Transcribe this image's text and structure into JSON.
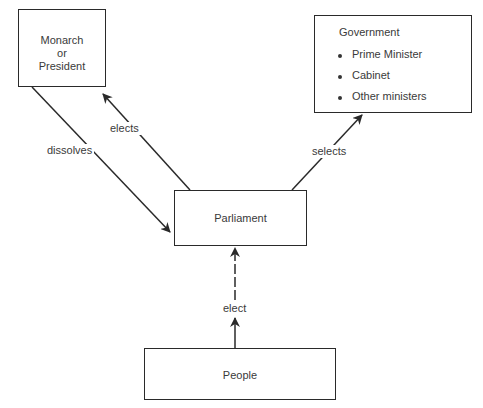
{
  "diagram": {
    "nodes": {
      "monarch": {
        "lines": [
          "Monarch",
          "or",
          "President"
        ]
      },
      "government": {
        "title": "Government",
        "items": [
          "Prime Minister",
          "Cabinet",
          "Other ministers"
        ]
      },
      "parliament": {
        "label": "Parliament"
      },
      "people": {
        "label": "People"
      }
    },
    "edges": [
      {
        "from": "Parliament",
        "to": "Monarch or President",
        "label": "elects"
      },
      {
        "from": "Monarch or President",
        "to": "Parliament",
        "label": "dissolves"
      },
      {
        "from": "Parliament",
        "to": "Government",
        "label": "selects"
      },
      {
        "from": "People",
        "to": "Parliament",
        "label": "elect"
      }
    ],
    "colors": {
      "line": "#2a2a2a",
      "text": "#3a3a3a",
      "background": "#ffffff"
    }
  }
}
